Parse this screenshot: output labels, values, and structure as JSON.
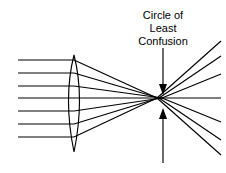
{
  "figure": {
    "title_lines": [
      "Circle of",
      "Least",
      "Confusion"
    ],
    "background_color": "#ffffff",
    "line_color": "#000000",
    "text_color": "#000000",
    "width": 226,
    "height": 173
  },
  "caption": {
    "line1": "Circle of",
    "line2": "Least",
    "line3": "Confusion",
    "center_x": 163,
    "line1_y": 19,
    "line2_y": 32,
    "line3_y": 45,
    "font_size": 11
  },
  "lens": {
    "label": "biconvex-lens",
    "center_x": 74,
    "top_y": 55,
    "bottom_y": 152,
    "half_width": 11
  },
  "axis": {
    "label": "optical-axis",
    "y": 98,
    "x_start": 18,
    "x_end": 221
  },
  "rays": {
    "count": 7,
    "entry_x": 18,
    "lens_x": 74,
    "exit_x": 221,
    "entry_y": [
      60,
      73,
      86,
      98,
      111,
      124,
      137
    ],
    "focus_x": [
      160,
      158,
      156,
      221,
      156,
      158,
      160
    ],
    "focus_y": [
      98,
      98,
      98,
      98,
      98,
      98,
      98
    ],
    "exit_y": [
      155,
      140,
      125,
      98,
      71,
      77,
      62
    ]
  },
  "pointers": {
    "top": {
      "name": "top-arrow",
      "x": 163,
      "y_start": 48,
      "y_end": 92,
      "direction": "down"
    },
    "bottom": {
      "name": "bottom-arrow",
      "x": 163,
      "y_start": 163,
      "y_end": 106,
      "direction": "up"
    }
  }
}
